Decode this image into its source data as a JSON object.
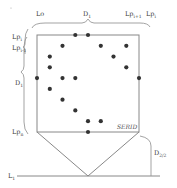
{
  "diagram": {
    "title": "",
    "labels": {
      "top_left": "Lo",
      "top_center": "D",
      "top_center_sub": "1",
      "top_right_a": "Lp",
      "top_right_a_sub": "i+1",
      "top_right_b": "Lp",
      "top_right_b_sub": "i",
      "left_top_a": "Lp",
      "left_top_a_sub": "i",
      "left_top_b": "Lp",
      "left_top_b_sub": "i-1",
      "left_mid": "D",
      "left_mid_sub": "1",
      "left_bottom": "Lp",
      "left_bottom_sub": "n",
      "box_label": "SERID",
      "right_height": "D",
      "right_height_sub": "2/2",
      "baseline": "L",
      "baseline_sub": "1"
    },
    "points_grid_note": "Points arranged in a circle around the square boundary",
    "points": [
      {
        "col": 3,
        "row": 0
      },
      {
        "col": 4,
        "row": 0
      },
      {
        "col": 2,
        "row": 1
      },
      {
        "col": 5,
        "row": 1
      },
      {
        "col": 7,
        "row": 1
      },
      {
        "col": 1,
        "row": 2
      },
      {
        "col": 6,
        "row": 2
      },
      {
        "col": 1,
        "row": 3
      },
      {
        "col": 7,
        "row": 3
      },
      {
        "col": 0,
        "row": 4
      },
      {
        "col": 2,
        "row": 4
      },
      {
        "col": 3,
        "row": 4
      },
      {
        "col": 8,
        "row": 4
      },
      {
        "col": 1,
        "row": 5
      },
      {
        "col": 2,
        "row": 6
      },
      {
        "col": 3,
        "row": 7
      },
      {
        "col": 4,
        "row": 8
      },
      {
        "col": 5,
        "row": 8
      },
      {
        "col": 4,
        "row": 9
      }
    ]
  }
}
